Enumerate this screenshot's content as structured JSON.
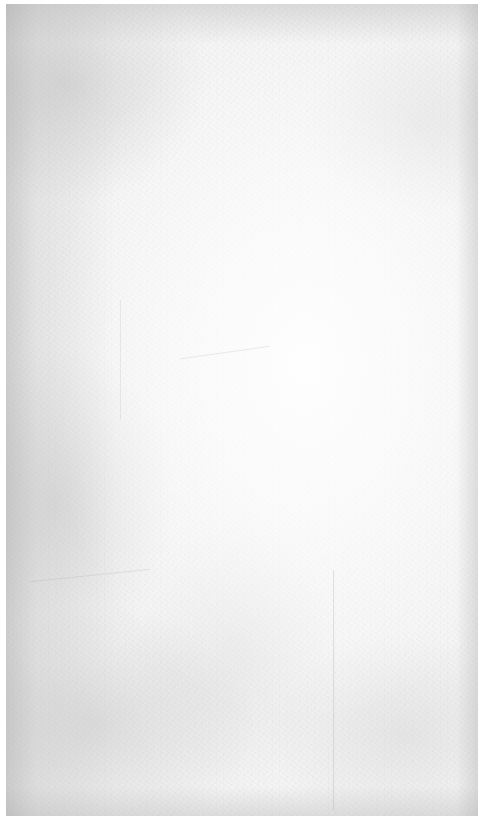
{
  "background": {
    "kind": "grunge-paper-texture",
    "base_color": "#f4f4f4",
    "border_color": "#ffffff",
    "shade_color": "#b9b9b9"
  }
}
